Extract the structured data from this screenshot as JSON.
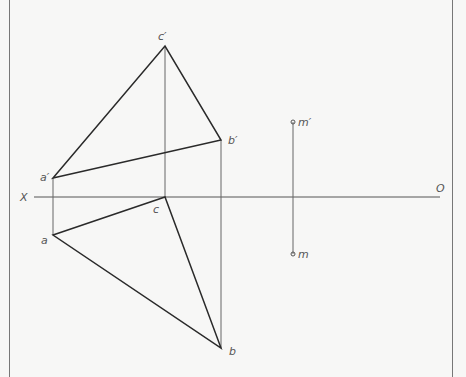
{
  "diagram": {
    "type": "descriptive-geometry-projection",
    "axis": {
      "left_label": "X",
      "right_label": "O"
    },
    "points": {
      "a_prime": {
        "label": "a′",
        "x": 53,
        "y": 178
      },
      "b_prime": {
        "label": "b′",
        "x": 221,
        "y": 140
      },
      "c_prime": {
        "label": "c′",
        "x": 165,
        "y": 46
      },
      "a": {
        "label": "a",
        "x": 53,
        "y": 235
      },
      "b": {
        "label": "b",
        "x": 221,
        "y": 348
      },
      "c": {
        "label": "c",
        "x": 165,
        "y": 197
      },
      "m_prime": {
        "label": "m′",
        "x": 293,
        "y": 122
      },
      "m": {
        "label": "m",
        "x": 293,
        "y": 254
      }
    },
    "colors": {
      "stroke": "#2a2a2a",
      "thin": "#666666",
      "label": "#555555",
      "background": "#f7f7f6"
    }
  }
}
